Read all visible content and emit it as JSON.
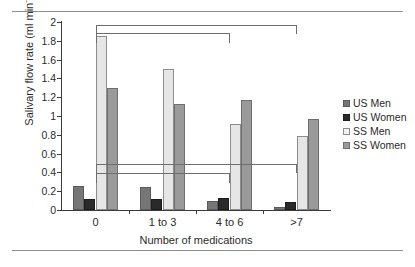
{
  "chart_data": {
    "type": "bar",
    "title": "",
    "xlabel": "Number of medications",
    "ylabel": "Salivary flow rate (ml min",
    "ylabel_sup": "-1",
    "ylabel_tail": ")",
    "categories": [
      "0",
      "1 to 3",
      "4 to 6",
      ">7"
    ],
    "ylim": [
      0,
      2
    ],
    "yticks": [
      "0",
      "0.2",
      "0.4",
      "0.6",
      "0.8",
      "1",
      "1.2",
      "1.4",
      "1.6",
      "1.8",
      "2"
    ],
    "ytick_values": [
      0,
      0.2,
      0.4,
      0.6,
      0.8,
      1.0,
      1.2,
      1.4,
      1.6,
      1.8,
      2.0
    ],
    "grid": false,
    "legend_position": "right",
    "series": [
      {
        "name": "US Men",
        "key": "us-men",
        "color": "#767676",
        "values": [
          0.26,
          0.24,
          0.1,
          0.03
        ]
      },
      {
        "name": "US Women",
        "key": "us-women",
        "color": "#2a2a2a",
        "values": [
          0.12,
          0.115,
          0.13,
          0.09
        ]
      },
      {
        "name": "SS Men",
        "key": "ss-men",
        "color": "#e6e6e6",
        "values": [
          1.85,
          1.5,
          0.92,
          0.79
        ]
      },
      {
        "name": "SS Women",
        "key": "ss-women",
        "color": "#9a9a9a",
        "values": [
          1.3,
          1.13,
          1.17,
          0.97
        ]
      }
    ],
    "annotations": [
      {
        "name": "sig-bracket-ss-0-vs-gt7",
        "from_category": "0",
        "to_category": ">7",
        "level": 1.97,
        "drop": 0.1
      },
      {
        "name": "sig-bracket-ss-0-vs-4to6",
        "from_category": "0",
        "to_category": "4 to 6",
        "level": 1.88,
        "drop": 0.1
      },
      {
        "name": "sig-bracket-us-0-vs-gt7",
        "from_category": "0",
        "to_category": ">7",
        "level": 0.49,
        "drop": 0.1
      },
      {
        "name": "sig-bracket-us-0-vs-4to6",
        "from_category": "0",
        "to_category": "4 to 6",
        "level": 0.39,
        "drop": 0.1
      }
    ]
  },
  "legend": {
    "items": [
      {
        "label": "US Men",
        "swatch": "us-men"
      },
      {
        "label": "US Women",
        "swatch": "us-women"
      },
      {
        "label": "SS Men",
        "swatch": "ss-men"
      },
      {
        "label": "SS Women",
        "swatch": "ss-women"
      }
    ]
  }
}
